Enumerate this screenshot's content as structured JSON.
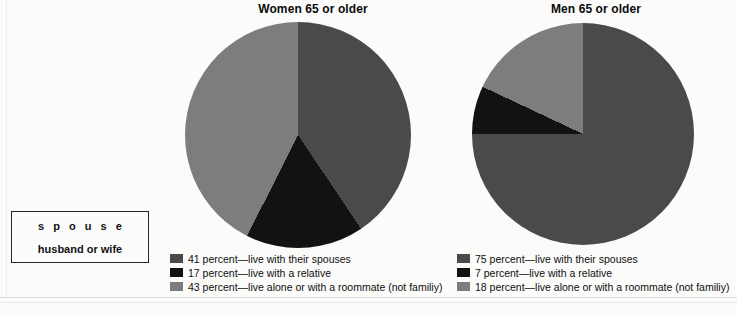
{
  "chart_data": [
    {
      "type": "pie",
      "title": "Women 65 or older",
      "categories": [
        "live with their spouses",
        "live with a relative",
        "live alone or with a roommate (not familiy)"
      ],
      "values": [
        41,
        17,
        43
      ],
      "unit": "percent",
      "colors": [
        "#4a4a4a",
        "#121212",
        "#7d7d7d"
      ],
      "legend_position": "bottom",
      "grid": false,
      "start_angle_deg": 0,
      "direction": "clockwise"
    },
    {
      "type": "pie",
      "title": "Men 65 or older",
      "categories": [
        "live with their spouses",
        "live with a relative",
        "live alone or with a roommate (not familiy)"
      ],
      "values": [
        75,
        7,
        18
      ],
      "unit": "percent",
      "colors": [
        "#4a4a4a",
        "#121212",
        "#7d7d7d"
      ],
      "legend_position": "bottom",
      "grid": false,
      "start_angle_deg": 0,
      "direction": "clockwise"
    }
  ],
  "women": {
    "title": "Women 65 or older",
    "legend": [
      {
        "swatch": "#4a4a4a",
        "label": "41 percent—live with their spouses"
      },
      {
        "swatch": "#121212",
        "label": "17 percent—live with a relative"
      },
      {
        "swatch": "#7d7d7d",
        "label": "43 percent—live alone or with a roommate (not familiy)"
      }
    ]
  },
  "men": {
    "title": "Men 65 or older",
    "legend": [
      {
        "swatch": "#4a4a4a",
        "label": "75 percent—live with their spouses"
      },
      {
        "swatch": "#121212",
        "label": "7 percent—live with a relative"
      },
      {
        "swatch": "#7d7d7d",
        "label": "18 percent—live alone or with a roommate (not familiy)"
      }
    ]
  },
  "vocabulary": {
    "word": "s p o u s e",
    "definition": "husband or wife"
  }
}
